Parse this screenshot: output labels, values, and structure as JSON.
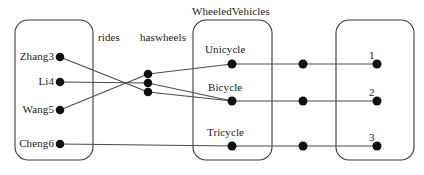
{
  "diagram": {
    "type": "entity-relationship-graph",
    "title": "WheeledVehicles",
    "relations": {
      "rides": "rides",
      "haswheels": "haswheels"
    },
    "boxes": [
      {
        "id": "people-box",
        "label": "",
        "x": 15,
        "y": 20,
        "width": 78,
        "height": 140,
        "nodes": [
          {
            "id": "zhang3",
            "label": "Zhang3",
            "x": 60,
            "y": 57
          },
          {
            "id": "li4",
            "label": "Li4",
            "x": 60,
            "y": 82
          },
          {
            "id": "wang5",
            "label": "Wang5",
            "x": 60,
            "y": 110
          },
          {
            "id": "cheng6",
            "label": "Cheng6",
            "x": 60,
            "y": 144
          }
        ]
      },
      {
        "id": "vehicles-box",
        "label": "WheeledVehicles",
        "x": 193,
        "y": 20,
        "width": 79,
        "height": 140,
        "nodes": [
          {
            "id": "unicycle",
            "label": "Unicycle",
            "x": 232,
            "y": 64
          },
          {
            "id": "bicycle",
            "label": "Bicycle",
            "x": 232,
            "y": 101
          },
          {
            "id": "tricycle",
            "label": "Tricycle",
            "x": 232,
            "y": 146
          }
        ]
      },
      {
        "id": "numbers-box",
        "label": "",
        "x": 336,
        "y": 20,
        "width": 78,
        "height": 140,
        "nodes": [
          {
            "id": "num-1",
            "label": "1",
            "x": 377,
            "y": 64
          },
          {
            "id": "num-2",
            "label": "2",
            "x": 377,
            "y": 101
          },
          {
            "id": "num-3",
            "label": "3",
            "x": 377,
            "y": 146
          }
        ]
      }
    ],
    "junction_nodes": [
      {
        "id": "junction-top",
        "x": 148,
        "y": 74
      },
      {
        "id": "junction-mid",
        "x": 148,
        "y": 83
      },
      {
        "id": "junction-low",
        "x": 148,
        "y": 92
      }
    ],
    "wheel_nodes": [
      {
        "id": "wheelcount-1",
        "x": 303,
        "y": 64
      },
      {
        "id": "wheelcount-2",
        "x": 303,
        "y": 101
      },
      {
        "id": "wheelcount-3",
        "x": 303,
        "y": 146
      }
    ],
    "edges": [
      {
        "id": "edge-zhang3-junction",
        "from": "zhang3",
        "to": "junction-low"
      },
      {
        "id": "edge-li4-junction",
        "from": "li4",
        "to": "junction-mid"
      },
      {
        "id": "edge-wang5-junction",
        "from": "wang5",
        "to": "junction-top"
      },
      {
        "id": "edge-junction-unicycle",
        "from": "junction-top",
        "to": "unicycle"
      },
      {
        "id": "edge-junction-bicycle-a",
        "from": "junction-mid",
        "to": "bicycle"
      },
      {
        "id": "edge-junction-bicycle-b",
        "from": "junction-low",
        "to": "bicycle"
      },
      {
        "id": "edge-cheng6-tricycle",
        "from": "cheng6",
        "to": "tricycle"
      },
      {
        "id": "edge-unicycle-wheel1",
        "from": "unicycle",
        "to": "wheelcount-1"
      },
      {
        "id": "edge-bicycle-wheel2",
        "from": "bicycle",
        "to": "wheelcount-2"
      },
      {
        "id": "edge-tricycle-wheel3",
        "from": "tricycle",
        "to": "wheelcount-3"
      },
      {
        "id": "edge-wheel1-num1",
        "from": "wheelcount-1",
        "to": "num-1"
      },
      {
        "id": "edge-wheel2-num2",
        "from": "wheelcount-2",
        "to": "num-2"
      },
      {
        "id": "edge-wheel3-num3",
        "from": "wheelcount-3",
        "to": "num-3"
      }
    ],
    "colors": {
      "stroke": "#3b3b3b",
      "edge": "#4a4a4a",
      "dot": "#111111",
      "text": "#1a1a1a",
      "background": "#ffffff"
    }
  }
}
